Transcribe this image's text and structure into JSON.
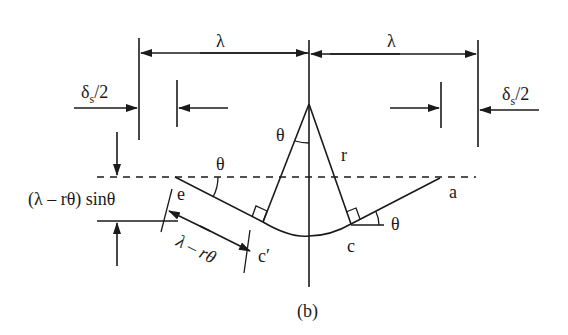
{
  "figure": {
    "caption": "(b)",
    "labels": {
      "lambda_left": "λ",
      "lambda_right": "λ",
      "delta_left_main": "δ",
      "delta_left_sub": "s",
      "delta_left_tail": "/2",
      "delta_right_main": "δ",
      "delta_right_sub": "s",
      "delta_right_tail": "/2",
      "theta_apex": "θ",
      "theta_left": "θ",
      "theta_right": "θ",
      "radius": "r",
      "point_e": "e",
      "point_a": "a",
      "point_c": "c",
      "point_c_prime": "c′",
      "height_expr": "(λ – rθ) sinθ",
      "length_expr": "λ – rθ"
    },
    "colors": {
      "stroke": "#1a1a1a",
      "background": "#ffffff"
    }
  }
}
